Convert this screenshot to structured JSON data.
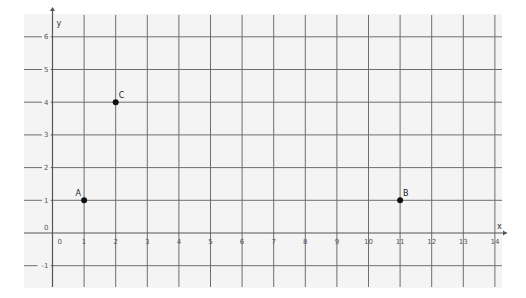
{
  "graph": {
    "background_color": "#f4f4f4",
    "grid_color": "#6e6e6e",
    "x_axis": {
      "name": "x",
      "min": 0,
      "max": 14,
      "ticks": [
        "0",
        "1",
        "2",
        "3",
        "4",
        "5",
        "6",
        "7",
        "8",
        "9",
        "10",
        "11",
        "12",
        "13",
        "14"
      ]
    },
    "y_axis": {
      "name": "y",
      "min": -1,
      "max": 6,
      "ticks": [
        "-1",
        "0",
        "1",
        "2",
        "3",
        "4",
        "5",
        "6"
      ]
    },
    "points": [
      {
        "label": "A",
        "x": 1,
        "y": 1
      },
      {
        "label": "B",
        "x": 11,
        "y": 1
      },
      {
        "label": "C",
        "x": 2,
        "y": 4
      }
    ]
  }
}
